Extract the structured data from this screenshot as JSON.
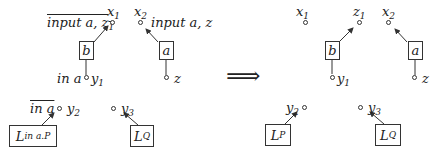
{
  "left": {
    "labels": {
      "x1": "x",
      "x1_sub": "1",
      "x2": "x",
      "x2_sub": "2",
      "input_bar_z1": "input a, z",
      "input_bar_z1_sub": "1",
      "input_z": "input a, z",
      "in_a": "in a",
      "y1": "y",
      "y1_sub": "1",
      "z": "z",
      "in_a_bar": "in a",
      "y2": "y",
      "y2_sub": "2",
      "y3": "y",
      "y3_sub": "3"
    },
    "boxes": {
      "b": "b",
      "a": "a",
      "L_in": "L",
      "L_in_sub": "in a.P",
      "LQ": "L",
      "LQ_sub": "Q"
    }
  },
  "arrow": "⟹",
  "right": {
    "labels": {
      "x1": "x",
      "x1_sub": "1",
      "z1": "z",
      "z1_sub": "1",
      "x2": "x",
      "x2_sub": "2",
      "y1": "y",
      "y1_sub": "1",
      "z": "z",
      "y2": "y",
      "y2_sub": "2",
      "y3": "y",
      "y3_sub": "3"
    },
    "boxes": {
      "b": "b",
      "a": "a",
      "LP": "L",
      "LP_sub": "P",
      "LQ": "L",
      "LQ_sub": "Q"
    }
  }
}
